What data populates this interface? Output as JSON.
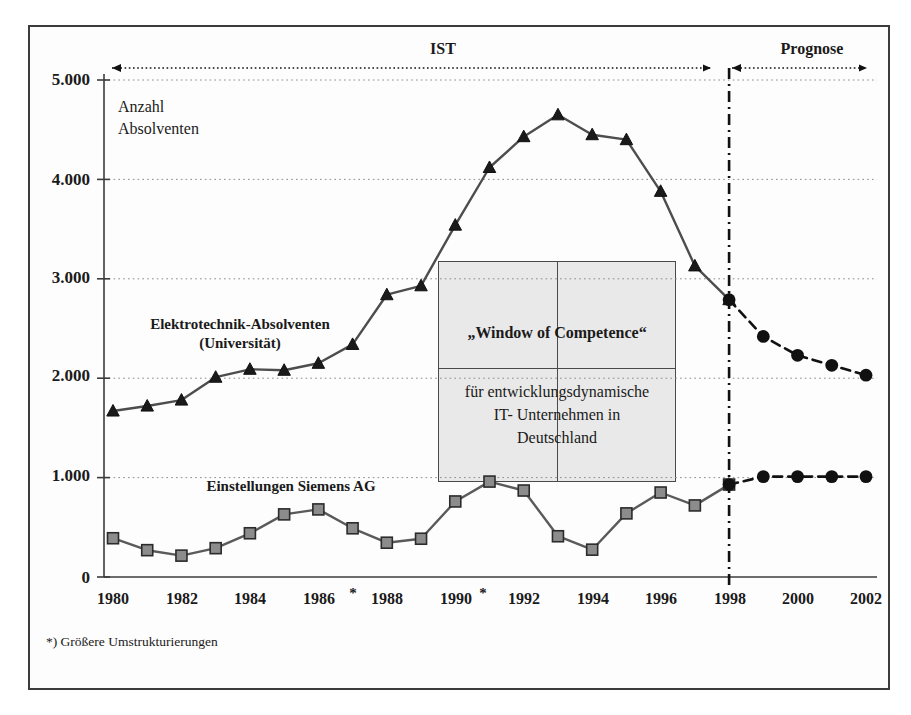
{
  "chart_data": {
    "type": "line",
    "title": "",
    "ylabel": "Anzahl Absolventen",
    "xlabel": "",
    "ylim": [
      0,
      5000
    ],
    "yticks": [
      0,
      1000,
      2000,
      3000,
      4000,
      5000
    ],
    "ytick_labels": [
      "0",
      "1.000",
      "2.000",
      "3.000",
      "4.000",
      "5.000"
    ],
    "grid": "horizontal-dotted",
    "legend": "inline-labels",
    "x": [
      1980,
      1981,
      1982,
      1983,
      1984,
      1985,
      1986,
      1987,
      1988,
      1989,
      1990,
      1991,
      1992,
      1993,
      1994,
      1995,
      1996,
      1997,
      1998,
      1999,
      2000,
      2001,
      2002
    ],
    "xtick_labels": [
      "1980",
      "1982",
      "1984",
      "1986",
      "1988",
      "1990",
      "1992",
      "1994",
      "1996",
      "1998",
      "2000",
      "2002"
    ],
    "xticks": [
      1980,
      1982,
      1984,
      1986,
      1988,
      1990,
      1992,
      1994,
      1996,
      1998,
      2000,
      2002
    ],
    "star_marks": [
      1987,
      1991
    ],
    "series": [
      {
        "name": "Elektrotechnik-Absolventen (Universität)",
        "marker": "triangle",
        "color": "#1a1a1a",
        "line_color": "#4d4d4d",
        "actual_x": [
          1980,
          1981,
          1982,
          1983,
          1984,
          1985,
          1986,
          1987,
          1988,
          1989,
          1990,
          1991,
          1992,
          1993,
          1994,
          1995,
          1996,
          1997,
          1998
        ],
        "actual_values": [
          1670,
          1720,
          1780,
          2010,
          2090,
          2080,
          2150,
          2340,
          2840,
          2930,
          3540,
          4120,
          4430,
          4650,
          4450,
          4400,
          3880,
          3130,
          2790
        ],
        "forecast_x": [
          1998,
          1999,
          2000,
          2001,
          2002
        ],
        "forecast_values": [
          2790,
          2420,
          2230,
          2130,
          2030
        ]
      },
      {
        "name": "Einstellungen Siemens AG",
        "marker": "square",
        "color": "#8c8c8c",
        "line_color": "#5a5a5a",
        "actual_x": [
          1980,
          1981,
          1982,
          1983,
          1984,
          1985,
          1986,
          1987,
          1988,
          1989,
          1990,
          1991,
          1992,
          1993,
          1994,
          1995,
          1996,
          1997,
          1998
        ],
        "actual_values": [
          390,
          270,
          215,
          290,
          440,
          630,
          680,
          490,
          345,
          385,
          760,
          960,
          870,
          410,
          275,
          640,
          850,
          720,
          930
        ],
        "forecast_x": [
          1998,
          1999,
          2000,
          2001,
          2002
        ],
        "forecast_values": [
          930,
          1010,
          1010,
          1010,
          1010
        ]
      }
    ],
    "annotations": {
      "ist_label": "IST",
      "prognose_label": "Prognose",
      "divider_year": 1998,
      "box_title": "„Window of Competence“",
      "box_subtitle": "für entwicklungsdynamische\nIT- Unternehmen in\nDeutschland",
      "footnote": "*) Größere Umstrukturierungen"
    }
  },
  "axis": {
    "y_title_line1": "Anzahl",
    "y_title_line2": "Absolventen",
    "ytick_0": "0",
    "ytick_1000": "1.000",
    "ytick_2000": "2.000",
    "ytick_3000": "3.000",
    "ytick_4000": "4.000",
    "ytick_5000": "5.000"
  },
  "xaxis": {
    "t1980": "1980",
    "t1982": "1982",
    "t1984": "1984",
    "t1986": "1986",
    "t1988": "1988",
    "t1990": "1990",
    "t1992": "1992",
    "t1994": "1994",
    "t1996": "1996",
    "t1998": "1998",
    "t2000": "2000",
    "t2002": "2002",
    "star_a": "*",
    "star_b": "*"
  },
  "phases": {
    "ist": "IST",
    "prognose": "Prognose"
  },
  "series_labels": {
    "upper_line1": "Elektrotechnik-Absolventen",
    "upper_line2": "(Universität)",
    "lower": "Einstellungen Siemens AG"
  },
  "window_box": {
    "title": "„Window of Competence“",
    "sub_line1": "für entwicklungsdynamische",
    "sub_line2": "IT- Unternehmen in",
    "sub_line3": "Deutschland"
  },
  "footnote": {
    "text": "*) Größere Umstrukturierungen"
  },
  "colors": {
    "frame": "#3c3c3c",
    "axis": "#3c3c3c",
    "grid": "#8a8a8a",
    "upper_marker": "#1a1a1a",
    "lower_marker": "#8c8c8c",
    "box_fill": "#e9e9e9"
  }
}
